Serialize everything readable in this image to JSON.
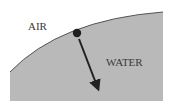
{
  "diagram": {
    "labels": {
      "air": "AIR",
      "water": "WATER"
    },
    "colors": {
      "water": "#b9b9b9",
      "surface_line": "#555555",
      "particle": "#1e1e1e",
      "arrow": "#222222",
      "text": "#3a3a3a"
    },
    "elements": {
      "water_region": "curved water surface",
      "particle": "dot on surface",
      "arrow": "direction into water"
    }
  }
}
